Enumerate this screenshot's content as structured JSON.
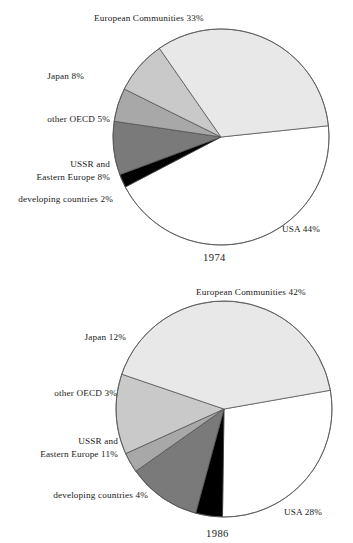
{
  "chart_data": [
    {
      "type": "pie",
      "title": "1974",
      "year_label": "1974",
      "xlabel": "",
      "ylabel": "",
      "legend": "labels placed outside slices with leader-free callouts",
      "grid": false,
      "categories": [
        "USA",
        "European Communities",
        "Japan",
        "other OECD",
        "USSR and Eastern Europe",
        "developing countries"
      ],
      "values": [
        44,
        33,
        8,
        5,
        8,
        2
      ],
      "labels": [
        "USA 44%",
        "European Communities 33%",
        "Japan 8%",
        "other OECD 5%",
        "USSR and\nEastern Europe 8%",
        "developing countries 2%"
      ],
      "colors": [
        "#ffffff",
        "#e8e8e8",
        "#c9c9c9",
        "#a8a8a8",
        "#7a7a7a",
        "#000000"
      ]
    },
    {
      "type": "pie",
      "title": "1986",
      "year_label": "1986",
      "xlabel": "",
      "ylabel": "",
      "legend": "labels placed outside slices with leader-free callouts",
      "grid": false,
      "categories": [
        "USA",
        "European Communities",
        "Japan",
        "other OECD",
        "USSR and Eastern Europe",
        "developing countries"
      ],
      "values": [
        28,
        42,
        12,
        3,
        11,
        4
      ],
      "labels": [
        "USA 28%",
        "European Communities 42%",
        "Japan 12%",
        "other OECD 3%",
        "USSR and\nEastern Europe 11%",
        "developing countries 4%"
      ],
      "colors": [
        "#ffffff",
        "#e8e8e8",
        "#c9c9c9",
        "#a8a8a8",
        "#7a7a7a",
        "#000000"
      ]
    }
  ],
  "chart1974": {
    "year": "1974",
    "label_ec": "European Communities 33%",
    "label_japan": "Japan 8%",
    "label_oecd": "other OECD 5%",
    "label_ussr_line1": "USSR and",
    "label_ussr_line2": "Eastern Europe 8%",
    "label_developing": "developing countries 2%",
    "label_usa": "USA 44%"
  },
  "chart1986": {
    "year": "1986",
    "label_ec": "European Communities 42%",
    "label_japan": "Japan 12%",
    "label_oecd": "other OECD 3%",
    "label_ussr_line1": "USSR and",
    "label_ussr_line2": "Eastern Europe 11%",
    "label_developing": "developing countries 4%",
    "label_usa": "USA 28%"
  }
}
